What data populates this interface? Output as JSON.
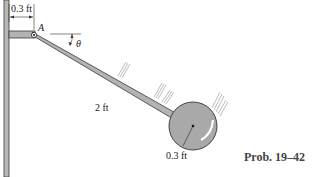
{
  "diagram": {
    "caption": "Prob. 19–42",
    "labels": {
      "offset_dimension": "0.3 ft",
      "pin": "A",
      "angle": "θ",
      "rod_length": "2 ft",
      "disk_radius": "0.3 ft"
    },
    "colors": {
      "member_fill": "#b3b3b3",
      "member_stroke": "#3a3a3a",
      "disk_fill": "#a9a9a9",
      "line": "#333333",
      "caption": "#444444"
    }
  }
}
